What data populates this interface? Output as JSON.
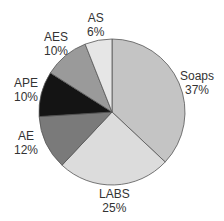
{
  "chart_data": {
    "type": "pie",
    "title": "",
    "categories": [
      "Soaps",
      "LABS",
      "AE",
      "APE",
      "AES",
      "AS"
    ],
    "values": [
      37,
      25,
      12,
      10,
      10,
      6
    ],
    "unit": "%",
    "colors": [
      "#c4c4c4",
      "#dcdcdc",
      "#7a7a7a",
      "#141414",
      "#9a9a9a",
      "#e6e6e6"
    ],
    "start_angle": "12 o'clock",
    "direction": "clockwise",
    "labels": [
      {
        "name": "Soaps",
        "pct": "37%"
      },
      {
        "name": "LABS",
        "pct": "25%"
      },
      {
        "name": "AE",
        "pct": "12%"
      },
      {
        "name": "APE",
        "pct": "10%"
      },
      {
        "name": "AES",
        "pct": "10%"
      },
      {
        "name": "AS",
        "pct": "6%"
      }
    ]
  }
}
